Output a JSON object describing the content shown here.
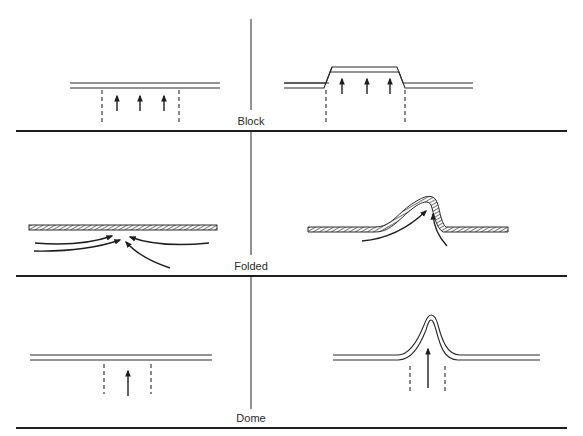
{
  "figure": {
    "panels": [
      {
        "id": "block",
        "label": "Block",
        "left": "before (flat layers with dashed fault boundaries and three upward arrows)",
        "right": "after (raised flat-topped block between faults)"
      },
      {
        "id": "folded",
        "label": "Folded",
        "left": "before (hatched layer with converging lateral and oblique arrows)",
        "right": "after (asymmetric fold with two arrows)"
      },
      {
        "id": "dome",
        "label": "Dome",
        "left": "before (flat layers with single upward arrow between dashed lines)",
        "right": "after (narrow dome pushed up by central arrow)"
      }
    ]
  },
  "colors": {
    "ink": "#2a2a2a",
    "background": "#ffffff"
  }
}
